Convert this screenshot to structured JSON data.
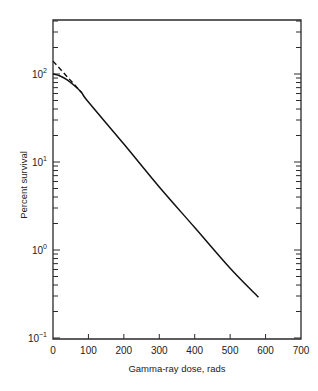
{
  "chart_data": {
    "type": "line",
    "title": "",
    "xlabel": "Gamma-ray dose, rads",
    "ylabel": "Percent survival",
    "x_scale": "linear",
    "y_scale": "log",
    "xlim": [
      0,
      700
    ],
    "ylim": [
      0.1,
      400
    ],
    "x_ticks": [
      0,
      100,
      200,
      300,
      400,
      500,
      600,
      700
    ],
    "x_tick_labels": [
      "0",
      "100",
      "200",
      "300",
      "400",
      "500",
      "600",
      "700"
    ],
    "y_ticks": [
      0.1,
      1,
      10,
      100
    ],
    "y_tick_labels": [
      {
        "base": "10",
        "exp": "−1"
      },
      {
        "base": "10",
        "exp": "0"
      },
      {
        "base": "10",
        "exp": "1"
      },
      {
        "base": "10",
        "exp": "2"
      }
    ],
    "grid": false,
    "legend": null,
    "series": [
      {
        "name": "Survival curve (shoulder)",
        "style": "solid",
        "x": [
          0,
          20,
          40,
          60,
          80,
          100,
          200,
          300,
          400,
          500,
          580
        ],
        "y": [
          100,
          95,
          86,
          74,
          62,
          48,
          16,
          5.2,
          1.8,
          0.62,
          0.29
        ]
      },
      {
        "name": "Extrapolated exponential",
        "style": "dashed",
        "x": [
          0,
          80
        ],
        "y": [
          140,
          62
        ]
      }
    ]
  }
}
